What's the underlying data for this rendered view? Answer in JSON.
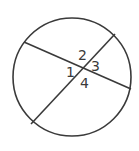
{
  "diagram": {
    "stroke_color": "#3a3a3a",
    "background": "#ffffff",
    "circle": {
      "cx": 72,
      "cy": 77,
      "r": 59
    },
    "chords": [
      {
        "name": "chord-a",
        "x1": 24,
        "y1": 42,
        "x2": 131,
        "y2": 89
      },
      {
        "name": "chord-b",
        "x1": 115,
        "y1": 34,
        "x2": 31,
        "y2": 124
      }
    ],
    "angle_labels": [
      {
        "text": "1",
        "x": 66,
        "y": 77
      },
      {
        "text": "2",
        "x": 78,
        "y": 60
      },
      {
        "text": "3",
        "x": 91,
        "y": 71
      },
      {
        "text": "4",
        "x": 80,
        "y": 88
      }
    ]
  }
}
